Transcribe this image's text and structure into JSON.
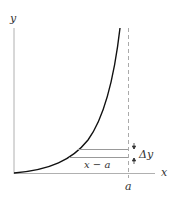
{
  "diagram": {
    "y_axis_label": "y",
    "x_axis_label": "x",
    "a_label": "a",
    "interval_label": "x − a",
    "delta_label": "Δy",
    "colors": {
      "axis": "#b0b0b0",
      "curve": "#111111",
      "dashed": "#aaaaaa",
      "guide": "#999999",
      "text": "#333333"
    }
  }
}
